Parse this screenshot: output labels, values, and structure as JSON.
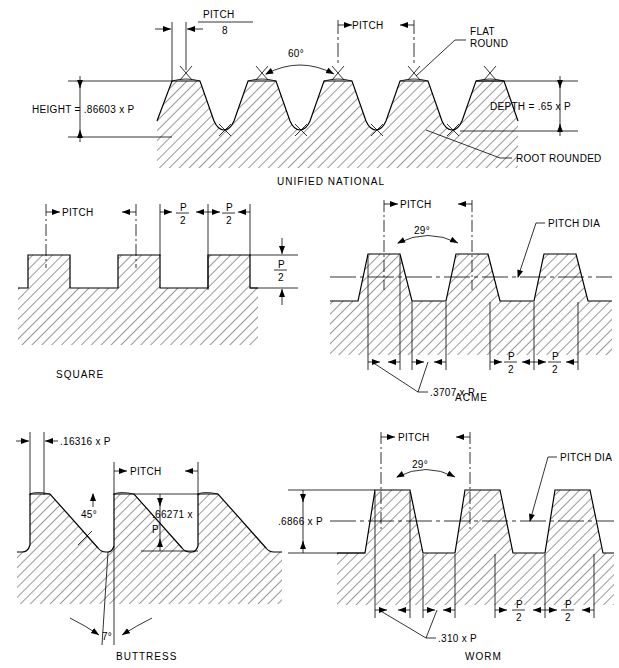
{
  "figure": {
    "line_color": "#000000",
    "background": "#ffffff"
  },
  "profiles": [
    {
      "id": "unified-national",
      "caption": "UNIFIED NATIONAL",
      "angle": "60°",
      "labels": {
        "pitch_over_8_top": "PITCH",
        "pitch_over_8_bottom": "8",
        "pitch": "PITCH",
        "height": "HEIGHT = .86603 x P",
        "depth": "DEPTH = .65 x P",
        "flat": "FLAT",
        "round": "ROUND",
        "root_rounded": "ROOT ROUNDED"
      }
    },
    {
      "id": "square",
      "caption": "SQUARE",
      "labels": {
        "pitch": "PITCH",
        "half_pitch_num": "P",
        "half_pitch_den": "2",
        "depth_num": "P",
        "depth_den": "2"
      }
    },
    {
      "id": "acme",
      "caption": "ACME",
      "angle": "29°",
      "labels": {
        "pitch": "PITCH",
        "pitch_dia": "PITCH DIA",
        "flat_width": ".3707 x P",
        "half_pitch_num": "P",
        "half_pitch_den": "2"
      }
    },
    {
      "id": "buttress",
      "caption": "BUTTRESS",
      "labels": {
        "crest_flat": ".16316 x P",
        "pitch": "PITCH",
        "angle_45": "45°",
        "angle_7": "7°",
        "depth_top": ".66271 x",
        "depth_bottom": "P"
      }
    },
    {
      "id": "worm",
      "caption": "WORM",
      "angle": "29°",
      "labels": {
        "pitch": "PITCH",
        "pitch_dia": "PITCH DIA",
        "height": ".6866 x P",
        "flat_width": ".310 x P",
        "half_pitch_num": "P",
        "half_pitch_den": "2"
      }
    }
  ]
}
